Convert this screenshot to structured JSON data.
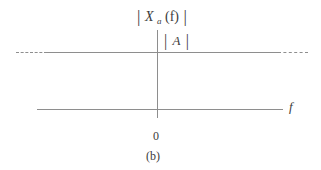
{
  "figure": {
    "kind": "signal-spectrum-plot",
    "subfigure_label": "(b)",
    "background_color": "#ffffff",
    "line_color": "#8e8e8e",
    "text_color": "#3b3b3b"
  },
  "labels": {
    "spectrum": {
      "full_text": "|Xa(f)|",
      "open_bar": "|",
      "symbol": "X",
      "subscript": "a",
      "argument": "(f)",
      "close_bar": "|"
    },
    "amplitude": {
      "full_text": "|A|",
      "open_bar": "|",
      "symbol": "A",
      "close_bar": "|"
    },
    "x_axis": "f",
    "origin": "0"
  },
  "chart_data": {
    "type": "line",
    "xlabel": "f",
    "ylabel": "|Xa(f)|",
    "grid": false,
    "legend": null,
    "xlim": [
      -1,
      1
    ],
    "ylim": [
      0,
      1.4
    ],
    "xticks": [
      0
    ],
    "xticklabels": [
      "0"
    ],
    "yticks": [
      1
    ],
    "yticklabels": [
      "|A|"
    ],
    "annotations": [
      {
        "text": "|A|",
        "x": 0.06,
        "y": 1.17
      },
      {
        "text": "0",
        "x": 0,
        "y": -0.18
      },
      {
        "text": "f",
        "x": 1.06,
        "y": 0.06
      }
    ],
    "series": [
      {
        "name": "|Xa(f)|",
        "style": "constant-level",
        "comment": "flat magnitude A for all f, drawn dashed at both ends to indicate continuation",
        "x": [
          -1.0,
          -0.75,
          0.0,
          0.75,
          1.0
        ],
        "values": [
          1.0,
          1.0,
          1.0,
          1.0,
          1.0
        ],
        "solid_x_range": [
          -0.75,
          0.75
        ],
        "dashed_x_ranges": [
          [
            -1.0,
            -0.75
          ],
          [
            0.75,
            1.0
          ]
        ]
      }
    ]
  }
}
